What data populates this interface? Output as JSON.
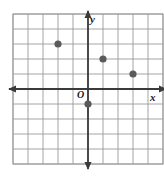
{
  "figure": {
    "kind": "coordinate-plane",
    "background_color": "#ffffff",
    "grid_color": "#9a9a9a",
    "axis_color": "#3a3a3a",
    "point_color": "#5a5a5a",
    "origin_label": "O",
    "x_axis_label": "x",
    "y_axis_label": "y"
  },
  "chart_data": {
    "type": "scatter",
    "title": "",
    "xlabel": "x",
    "ylabel": "y",
    "grid": true,
    "legend": null,
    "xlim": [
      -5,
      5
    ],
    "ylim": [
      -5,
      5
    ],
    "xticks": [
      -5,
      -4,
      -3,
      -2,
      -1,
      0,
      1,
      2,
      3,
      4,
      5
    ],
    "yticks": [
      -5,
      -4,
      -3,
      -2,
      -1,
      0,
      1,
      2,
      3,
      4,
      5
    ],
    "tick_labels_shown": false,
    "origin_label": "O",
    "series": [
      {
        "name": "points",
        "points": [
          {
            "x": -2,
            "y": 3
          },
          {
            "x": 1,
            "y": 2
          },
          {
            "x": 3,
            "y": 1
          },
          {
            "x": 0,
            "y": -1
          }
        ]
      }
    ]
  },
  "geometry": {
    "cell_px": 15,
    "origin_px": {
      "x": 88,
      "y": 89
    },
    "grid_bounds_px": {
      "left": 13,
      "top": 14,
      "right": 163,
      "bottom": 164
    },
    "point_radius_px": 3.6
  }
}
